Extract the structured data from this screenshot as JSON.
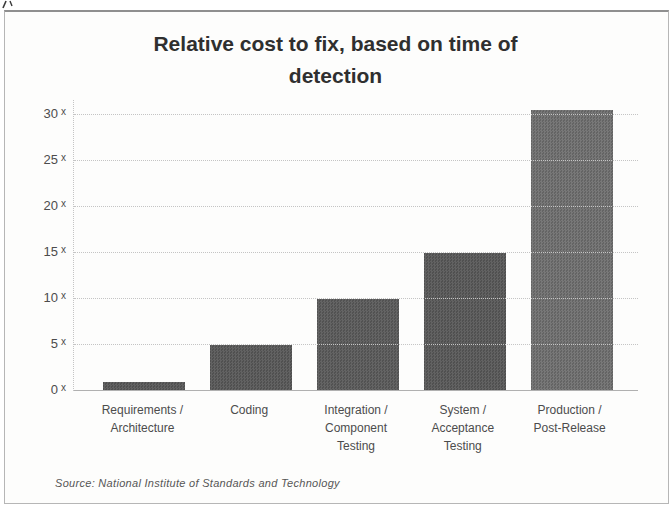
{
  "chart_data": {
    "type": "bar",
    "title": "Relative cost to fix, based on time of detection",
    "categories": [
      "Requirements / Architecture",
      "Coding",
      "Integration / Component Testing",
      "System / Acceptance Testing",
      "Production / Post-Release"
    ],
    "category_lines": [
      [
        "Requirements /",
        "Architecture"
      ],
      [
        "Coding"
      ],
      [
        "Integration /",
        "Component",
        "Testing"
      ],
      [
        "System /",
        "Acceptance",
        "Testing"
      ],
      [
        "Production /",
        "Post-Release"
      ]
    ],
    "values": [
      1,
      5,
      10,
      15,
      30.5
    ],
    "yticks": [
      0,
      5,
      10,
      15,
      20,
      25,
      30
    ],
    "ytick_suffix": "x",
    "ylim": [
      0,
      31.6
    ],
    "grid": true,
    "legend": false,
    "bar_colors": [
      [
        "#505050",
        "#626262"
      ],
      [
        "#505050",
        "#626262"
      ],
      [
        "#525252",
        "#646464"
      ],
      [
        "#505050",
        "#626262"
      ],
      [
        "#646464",
        "#787878"
      ]
    ],
    "grid_color": "#c4c4c4",
    "text_color": "#4c4c4c",
    "title_color": "#2f2f2f",
    "source_color": "#565656",
    "frame_color": "#b6b6b6",
    "source": "Source: National Institute of Standards and Technology"
  }
}
